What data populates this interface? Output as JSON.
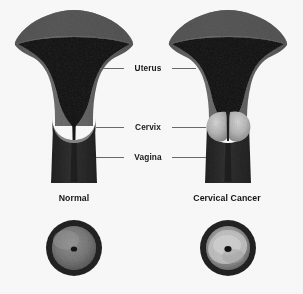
{
  "figure": {
    "background_color": "#fdfdfd",
    "annotations": [
      {
        "id": "uterus",
        "label": "Uterus",
        "x": 148,
        "y": 68
      },
      {
        "id": "cervix",
        "label": "Cervix",
        "x": 148,
        "y": 127
      },
      {
        "id": "vagina",
        "label": "Vagina",
        "x": 148,
        "y": 157
      }
    ],
    "panels": [
      {
        "id": "normal",
        "caption": "Normal",
        "caption_x": 74,
        "caption_y": 198,
        "condition": "healthy",
        "cervix_face": {
          "os_label": "external os",
          "lesion": false
        }
      },
      {
        "id": "cervical-cancer",
        "caption": "Cervical Cancer",
        "caption_x": 226,
        "caption_y": 198,
        "condition": "tumor",
        "cervix_face": {
          "os_label": "external os",
          "lesion": true
        }
      }
    ],
    "colors": {
      "myometrium": "#6e6e6e",
      "myometrium_dark": "#4a4a4a",
      "cavity": "#1d1d1d",
      "vagina": "#2b2b2b",
      "cervix_normal": "#8f8f8f",
      "tumor": "#c2c2c2",
      "leader_line": "#6b6b6b",
      "text": "#1a1a1a",
      "background": "#fdfdfd"
    }
  }
}
